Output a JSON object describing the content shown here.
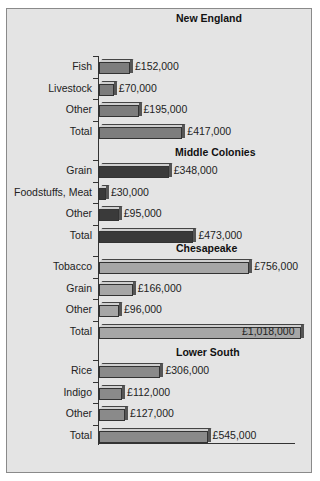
{
  "chart_data": {
    "type": "bar",
    "orientation": "horizontal",
    "title": "",
    "xlabel": "",
    "ylabel": "",
    "xlim": [
      0,
      1018000
    ],
    "grid": false,
    "currency": "£",
    "groups": [
      {
        "name": "New England",
        "color": "#7d7d7d",
        "categories": [
          "Fish",
          "Livestock",
          "Other",
          "Total"
        ],
        "values": [
          152000,
          70000,
          195000,
          417000
        ],
        "labels": [
          "£152,000",
          "£70,000",
          "£195,000",
          "£417,000"
        ]
      },
      {
        "name": "Middle Colonies",
        "color": "#3a3a3a",
        "categories": [
          "Grain",
          "Foodstuffs, Meat",
          "Other",
          "Total"
        ],
        "values": [
          348000,
          30000,
          95000,
          473000
        ],
        "labels": [
          "£348,000",
          "£30,000",
          "£95,000",
          "£473,000"
        ]
      },
      {
        "name": "Chesapeake",
        "color": "#a6a6a6",
        "categories": [
          "Tobacco",
          "Grain",
          "Other",
          "Total"
        ],
        "values": [
          756000,
          166000,
          96000,
          1018000
        ],
        "labels": [
          "£756,000",
          "£166,000",
          "£96,000",
          "£1,018,000"
        ]
      },
      {
        "name": "Lower South",
        "color": "#8a8a8a",
        "categories": [
          "Rice",
          "Indigo",
          "Other",
          "Total"
        ],
        "values": [
          306000,
          112000,
          127000,
          545000
        ],
        "labels": [
          "£306,000",
          "£112,000",
          "£127,000",
          "£545,000"
        ]
      }
    ]
  }
}
